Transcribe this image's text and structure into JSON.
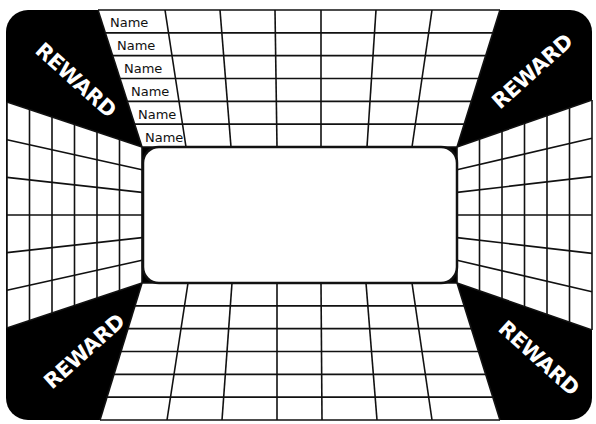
{
  "board": {
    "background_color": "#000000",
    "panel_color": "#ffffff",
    "line_color": "#111111",
    "center_box": {
      "label": ""
    },
    "name_labels": [
      "Name",
      "Name",
      "Name",
      "Name",
      "Name",
      "Name"
    ],
    "corners": {
      "top_left": "REWARD",
      "top_right": "REWARD",
      "bottom_left": "REWARD",
      "bottom_right": "REWARD"
    },
    "top_grid": {
      "rows": 6,
      "columns": 7
    },
    "bottom_grid": {
      "rows": 6,
      "columns": 7
    },
    "left_grid": {
      "rows": 6,
      "columns": 6
    },
    "right_grid": {
      "rows": 6,
      "columns": 6
    }
  }
}
